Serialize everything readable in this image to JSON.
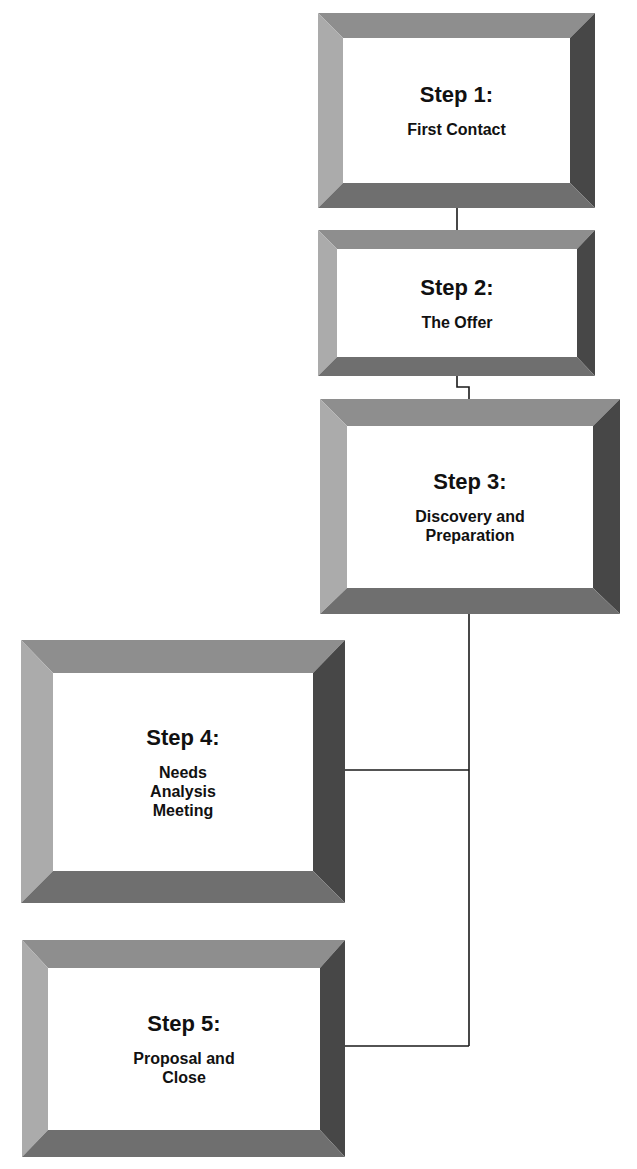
{
  "diagram": {
    "type": "process-flow",
    "colors": {
      "bevel_top": "#8e8e8e",
      "bevel_left": "#ababab",
      "bevel_right": "#474747",
      "bevel_bottom": "#6f6f6f",
      "face": "#ffffff",
      "text": "#111111",
      "connector": "#1a1a1a"
    },
    "steps": [
      {
        "title": "Step 1:",
        "label": "First Contact"
      },
      {
        "title": "Step 2:",
        "label": "The Offer"
      },
      {
        "title": "Step 3:",
        "label": "Discovery and\nPreparation"
      },
      {
        "title": "Step 4:",
        "label": "Needs\nAnalysis\nMeeting"
      },
      {
        "title": "Step 5:",
        "label": "Proposal and\nClose"
      }
    ]
  }
}
